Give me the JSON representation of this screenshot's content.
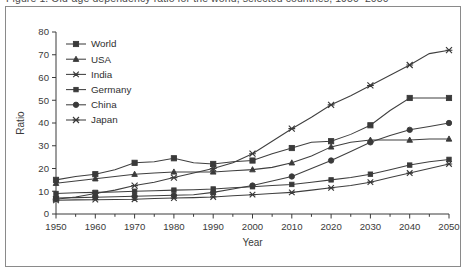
{
  "caption": {
    "text": "Figure 1. Old-age dependency ratio for the world, selected countries, 1950–2050"
  },
  "chart_data": {
    "type": "line",
    "title": "",
    "xlabel": "Year",
    "ylabel": "Ratio",
    "xlim": [
      1950,
      2050
    ],
    "ylim": [
      0,
      80
    ],
    "xticks": [
      1950,
      1960,
      1970,
      1980,
      1990,
      2000,
      2010,
      2020,
      2030,
      2040,
      2050
    ],
    "xtick_labels": [
      "1950",
      "1960",
      "1970",
      "1980",
      "1990",
      "2000",
      "2010",
      "2020",
      "2030",
      "2040",
      "2050"
    ],
    "x_minor_interval": 5,
    "yticks": [
      0,
      10,
      20,
      30,
      40,
      50,
      60,
      70,
      80
    ],
    "ytick_labels": [
      "0",
      "10",
      "20",
      "30",
      "40",
      "50",
      "60",
      "70",
      "80"
    ],
    "grid": false,
    "legend_position": "upper left inside",
    "x": [
      1950,
      1955,
      1960,
      1965,
      1970,
      1975,
      1980,
      1985,
      1990,
      1995,
      2000,
      2005,
      2010,
      2015,
      2020,
      2025,
      2030,
      2035,
      2040,
      2045,
      2050
    ],
    "series": [
      {
        "name": "World",
        "marker": "filled-square",
        "values": [
          15.0,
          16.5,
          17.5,
          19.5,
          22.5,
          23.0,
          24.5,
          22.5,
          22.0,
          23.0,
          23.5,
          26.5,
          29.0,
          31.5,
          32.0,
          35.0,
          39.0,
          45.5,
          51.0,
          51.0,
          51.0
        ]
      },
      {
        "name": "USA",
        "marker": "filled-triangle",
        "values": [
          13.5,
          14.5,
          15.5,
          16.5,
          17.5,
          18.0,
          18.5,
          18.5,
          18.5,
          19.0,
          19.5,
          20.5,
          22.5,
          25.5,
          29.5,
          31.5,
          32.5,
          32.5,
          32.5,
          33.0,
          33.0
        ]
      },
      {
        "name": "India",
        "marker": "x-cross",
        "values": [
          6.0,
          6.2,
          6.3,
          6.4,
          6.5,
          6.8,
          7.0,
          7.2,
          7.5,
          8.0,
          8.5,
          9.0,
          9.5,
          10.5,
          11.5,
          12.5,
          14.0,
          16.0,
          18.0,
          20.0,
          22.0
        ]
      },
      {
        "name": "Germany",
        "marker": "filled-square-small",
        "values": [
          9.0,
          9.3,
          9.5,
          9.7,
          10.0,
          10.2,
          10.5,
          10.7,
          11.0,
          11.5,
          12.0,
          12.5,
          13.0,
          14.0,
          15.0,
          16.0,
          17.5,
          19.5,
          21.5,
          23.0,
          24.0
        ]
      },
      {
        "name": "China",
        "marker": "filled-circle",
        "values": [
          7.0,
          7.2,
          7.4,
          7.6,
          7.8,
          8.0,
          8.2,
          8.5,
          9.5,
          11.0,
          12.5,
          14.5,
          16.5,
          20.0,
          23.5,
          27.5,
          31.5,
          34.5,
          37.0,
          38.5,
          40.0
        ]
      },
      {
        "name": "Japan",
        "marker": "star-cross",
        "values": [
          6.5,
          7.5,
          9.0,
          10.5,
          12.5,
          14.0,
          16.0,
          18.0,
          20.0,
          22.5,
          26.5,
          32.0,
          37.5,
          42.5,
          48.0,
          52.0,
          56.5,
          61.0,
          65.5,
          70.5,
          72.0
        ]
      }
    ],
    "legend": [
      "World",
      "USA",
      "India",
      "Germany",
      "China",
      "Japan"
    ]
  },
  "colors": {
    "axis": "#3a3a3a",
    "line": "#3f3f3f",
    "frame": "#8a8a8a",
    "background": "#ffffff"
  }
}
